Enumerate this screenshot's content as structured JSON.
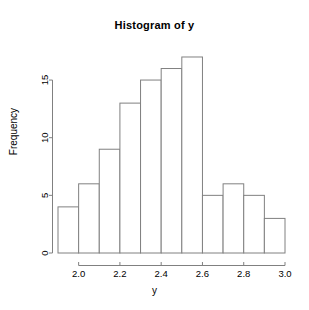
{
  "chart_data": {
    "type": "bar",
    "title": "Histogram of y",
    "xlabel": "y",
    "ylabel": "Frequency",
    "bin_width": 0.1,
    "bin_edges": [
      1.9,
      2.0,
      2.1,
      2.2,
      2.3,
      2.4,
      2.5,
      2.6,
      2.7,
      2.8,
      2.9,
      3.0
    ],
    "categories": [
      "1.9-2.0",
      "2.0-2.1",
      "2.1-2.2",
      "2.2-2.3",
      "2.3-2.4",
      "2.4-2.5",
      "2.5-2.6",
      "2.6-2.7",
      "2.7-2.8",
      "2.8-2.9",
      "2.9-3.0"
    ],
    "values": [
      4,
      6,
      9,
      13,
      15,
      16,
      17,
      5,
      6,
      5,
      3
    ],
    "xlim": [
      1.9,
      3.0
    ],
    "ylim": [
      0,
      17
    ],
    "xticks": [
      2.0,
      2.2,
      2.4,
      2.6,
      2.8,
      3.0
    ],
    "xtick_labels": [
      "2.0",
      "2.2",
      "2.4",
      "2.6",
      "2.8",
      "3.0"
    ],
    "yticks": [
      0,
      5,
      10,
      15
    ],
    "ytick_labels": [
      "0",
      "5",
      "10",
      "15"
    ],
    "grid": false,
    "legend": false,
    "bar_fill_color": "#ffffff",
    "bar_edge_color": "#808080",
    "axis_color": "#808080",
    "background_color": "#ffffff"
  }
}
